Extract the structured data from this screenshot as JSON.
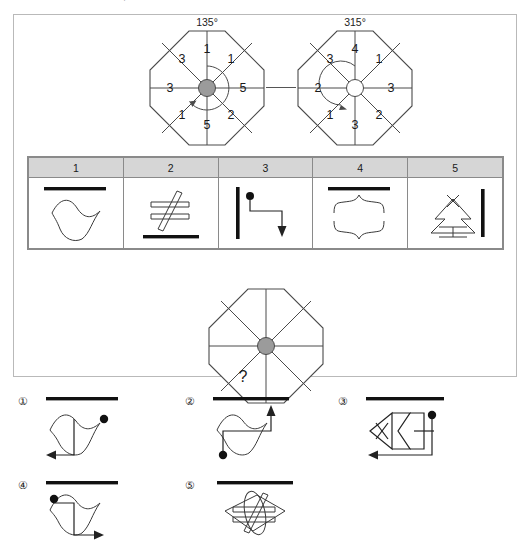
{
  "prompt": {
    "text": "다음 기호의 규칙을 찾아, 물음표에 들어갈 알맞은 것을 고르시오."
  },
  "panel": {
    "top_diagrams": [
      {
        "name": "left-octagon",
        "angle_label": "135°",
        "hub": "filled",
        "rotation_direction": "clockwise",
        "sector_values": [
          "1",
          "1",
          "5",
          "2",
          "5",
          "1",
          "3",
          "3"
        ]
      },
      {
        "name": "right-octagon",
        "angle_label": "315°",
        "hub": "open",
        "rotation_direction": "counterclockwise",
        "sector_values": [
          "4",
          "1",
          "3",
          "2",
          "3",
          "1",
          "2",
          "3"
        ]
      }
    ],
    "connector": "line",
    "legend": {
      "headers": [
        "1",
        "2",
        "3",
        "4",
        "5"
      ],
      "symbols": [
        {
          "key": "1",
          "name": "bar-over-wave",
          "description": "thick horizontal bar above an S-shaped wave"
        },
        {
          "key": "2",
          "name": "not-equal-over-bar",
          "description": "outlined not-equal sign above a thick horizontal bar"
        },
        {
          "key": "3",
          "name": "vertical-bar-dot-arrow",
          "description": "vertical thick bar with dot and elbow arrow pointing down"
        },
        {
          "key": "4",
          "name": "bar-over-braces",
          "description": "thick horizontal bar above two opposing curly braces"
        },
        {
          "key": "5",
          "name": "tree-and-vertical-bar",
          "description": "pine tree outline beside a vertical thick bar"
        }
      ]
    },
    "question_diagram": {
      "name": "question-octagon",
      "hub": "filled",
      "question_mark": "?"
    }
  },
  "choices": [
    {
      "number": "①",
      "name": "choice-1",
      "description": "bar above wave with dot top-right and left arrow at bottom"
    },
    {
      "number": "②",
      "name": "choice-2",
      "description": "bar above wave with dot bottom-left and up arrow at right"
    },
    {
      "number": "③",
      "name": "choice-3",
      "description": "bar above angular zigzag with X, dot top-right and left arrow"
    },
    {
      "number": "④",
      "name": "choice-4",
      "description": "bar above wave with dot top-left and right arrow at bottom"
    },
    {
      "number": "⑤",
      "name": "choice-5",
      "description": "bar above wave overlapping a not-equal sign"
    }
  ],
  "colors": {
    "panel_border": "#b9b9b9",
    "table_border": "#8a8a8a",
    "header_fill": "#d6d6d6",
    "hub_fill": "#9b9b9b",
    "ink": "#1a1a1a"
  }
}
